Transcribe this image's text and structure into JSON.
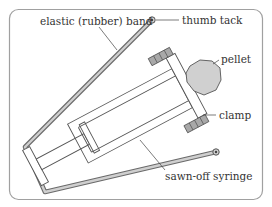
{
  "diagram": {
    "labels": {
      "elastic_band": "elastic (rubber) band",
      "thumb_tack": "thumb tack",
      "pellet": "pellet",
      "clamp": "clamp",
      "syringe": "sawn-off syringe"
    },
    "colors": {
      "frame": "#9a9a9a",
      "line": "#555555",
      "band_fill": "#c8c8c8",
      "pellet_fill": "#d0d0d0",
      "clamp_fill": "#a8a8a8",
      "text": "#333333"
    }
  }
}
